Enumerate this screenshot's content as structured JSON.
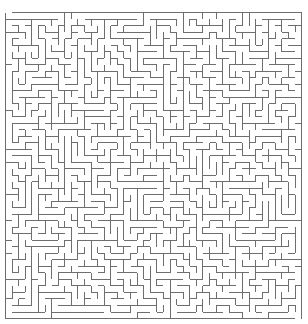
{
  "maze": {
    "cols": 45,
    "rows": 47,
    "origin_x": 5.5,
    "origin_y": 12.5,
    "cell_w": 6.58,
    "cell_h": 6.51,
    "seed": 20240611,
    "wall_color": "#6e6e6e",
    "wall_width": 1,
    "background": "#ffffff",
    "entrance": {
      "side": "top",
      "col": 0
    },
    "exit": {
      "side": "bottom",
      "col": 44
    }
  }
}
